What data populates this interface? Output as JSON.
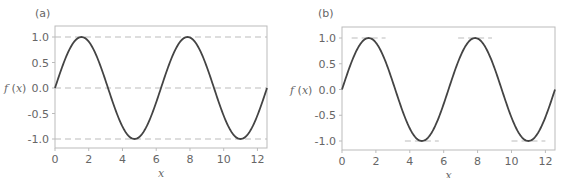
{
  "chart_data": [
    {
      "type": "line",
      "panel_label": "(a)",
      "title": "",
      "xlabel": "x",
      "ylabel": "f(x)",
      "function": "sin(x)",
      "xlim": [
        0,
        12.566
      ],
      "ylim": [
        -1.2,
        1.2
      ],
      "xticks": [
        0,
        2,
        4,
        6,
        8,
        10,
        12
      ],
      "xtick_labels": [
        "0",
        "2",
        "4",
        "6",
        "8",
        "10",
        "12"
      ],
      "yticks": [
        1.0,
        0.5,
        0.0,
        -0.5,
        -1.0
      ],
      "ytick_labels": [
        "1.0",
        "0.5",
        "0.0",
        "-0.5",
        "-1.0"
      ],
      "grid": false,
      "reference_lines": [
        {
          "y": 1.0,
          "style": "dashed",
          "x_range": [
            0,
            12.566
          ]
        },
        {
          "y": 0.0,
          "style": "dashed",
          "x_range": [
            0,
            12.566
          ]
        },
        {
          "y": -1.0,
          "style": "dashed",
          "x_range": [
            0,
            12.566
          ]
        }
      ],
      "series": [
        {
          "name": "f(x)",
          "x": [
            0,
            1.5708,
            3.1416,
            4.7124,
            6.2832,
            7.854,
            9.4248,
            10.9956,
            12.566
          ],
          "values": [
            0,
            1,
            0,
            -1,
            0,
            1,
            0,
            -1,
            0
          ]
        }
      ]
    },
    {
      "type": "line",
      "panel_label": "(b)",
      "title": "",
      "xlabel": "x",
      "ylabel": "f(x)",
      "function": "sin(x)",
      "xlim": [
        0,
        12.566
      ],
      "ylim": [
        -1.2,
        1.2
      ],
      "xticks": [
        0,
        2,
        4,
        6,
        8,
        10,
        12
      ],
      "xtick_labels": [
        "0",
        "2",
        "4",
        "6",
        "8",
        "10",
        "12"
      ],
      "yticks": [
        1.0,
        0.5,
        0.0,
        -0.5,
        -1.0
      ],
      "ytick_labels": [
        "1.0",
        "0.5",
        "0.0",
        "-0.5",
        "-1.0"
      ],
      "grid": false,
      "reference_lines": [
        {
          "y": 1.0,
          "style": "dashed",
          "x_range": [
            0.57,
            2.57
          ]
        },
        {
          "y": -1.0,
          "style": "dashed",
          "x_range": [
            3.71,
            5.71
          ]
        },
        {
          "y": 1.0,
          "style": "dashed",
          "x_range": [
            6.85,
            8.85
          ]
        },
        {
          "y": -1.0,
          "style": "dashed",
          "x_range": [
            10.0,
            12.0
          ]
        }
      ],
      "series": [
        {
          "name": "f(x)",
          "x": [
            0,
            1.5708,
            3.1416,
            4.7124,
            6.2832,
            7.854,
            9.4248,
            10.9956,
            12.566
          ],
          "values": [
            0,
            1,
            0,
            -1,
            0,
            1,
            0,
            -1,
            0
          ]
        }
      ]
    }
  ],
  "panels": {
    "a": {
      "label": "(a)",
      "ylabel_f": "f",
      "ylabel_arg": "(x)",
      "xlabel": "x"
    },
    "b": {
      "label": "(b)",
      "ylabel_f": "f",
      "ylabel_arg": "(x)",
      "xlabel": "x"
    }
  },
  "colors": {
    "curve": "#444444",
    "frame": "#bbbbbb",
    "dash": "#bbbbbb",
    "text": "#666666"
  }
}
